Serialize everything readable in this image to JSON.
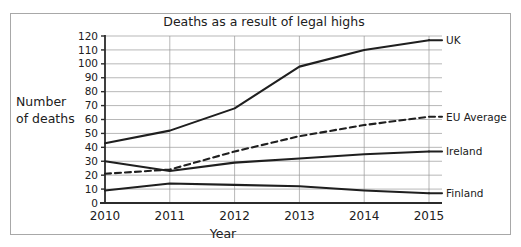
{
  "chart_data": {
    "type": "line",
    "title": "Deaths as a result of legal highs",
    "xlabel": "Year",
    "ylabel": "Number of deaths",
    "ylabel_line1": "Number",
    "ylabel_line2": "of deaths",
    "categories": [
      "2010",
      "2011",
      "2012",
      "2013",
      "2014",
      "2015"
    ],
    "x": [
      2010,
      2011,
      2012,
      2013,
      2014,
      2015
    ],
    "xlim": [
      2010,
      2015
    ],
    "ylim": [
      0,
      120
    ],
    "ytick_labels": [
      "0",
      "10",
      "20",
      "30",
      "40",
      "50",
      "60",
      "70",
      "80",
      "90",
      "100",
      "110",
      "120"
    ],
    "yticks": [
      0,
      10,
      20,
      30,
      40,
      50,
      60,
      70,
      80,
      90,
      100,
      110,
      120
    ],
    "grid": "horizontal-and-vertical",
    "legend_position": "right-of-plot-inline-labels",
    "series": [
      {
        "name": "UK",
        "style": "solid",
        "color": "#1f1f1f",
        "values": [
          43,
          52,
          68,
          98,
          110,
          117
        ]
      },
      {
        "name": "EU Average",
        "style": "dashed",
        "color": "#1f1f1f",
        "values": [
          21,
          24,
          37,
          48,
          56,
          62
        ]
      },
      {
        "name": "Ireland",
        "style": "solid",
        "color": "#1f1f1f",
        "values": [
          30,
          23,
          29,
          32,
          35,
          37
        ]
      },
      {
        "name": "Finland",
        "style": "solid",
        "color": "#1f1f1f",
        "values": [
          9,
          14,
          13,
          12,
          9,
          7
        ]
      }
    ]
  },
  "figure": {
    "background_color": "#ffffff",
    "border_color": "#a8a8a8",
    "axis_color": "#2b2b2b",
    "grid_color": "#9a9a9a"
  }
}
